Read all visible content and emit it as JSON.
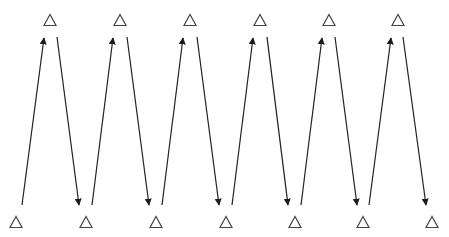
{
  "diagram": {
    "type": "zigzag-triangle-arrows",
    "colors": {
      "stroke": "#222222",
      "triangle": "#444444",
      "background": "#ffffff"
    },
    "top_triangles": [
      {
        "x": 50,
        "y": 20
      },
      {
        "x": 120,
        "y": 20
      },
      {
        "x": 190,
        "y": 20
      },
      {
        "x": 260,
        "y": 20
      },
      {
        "x": 329,
        "y": 20
      },
      {
        "x": 398,
        "y": 20
      }
    ],
    "bottom_triangles": [
      {
        "x": 16,
        "y": 222
      },
      {
        "x": 86,
        "y": 222
      },
      {
        "x": 156,
        "y": 222
      },
      {
        "x": 226,
        "y": 222
      },
      {
        "x": 295,
        "y": 222
      },
      {
        "x": 363,
        "y": 222
      },
      {
        "x": 432,
        "y": 222
      }
    ],
    "arrows": [
      {
        "dir": "up",
        "x1": 22,
        "y1": 205,
        "x2": 44,
        "y2": 38
      },
      {
        "dir": "down",
        "x1": 57,
        "y1": 37,
        "x2": 79,
        "y2": 205
      },
      {
        "dir": "up",
        "x1": 92,
        "y1": 205,
        "x2": 113,
        "y2": 38
      },
      {
        "dir": "down",
        "x1": 127,
        "y1": 37,
        "x2": 149,
        "y2": 205
      },
      {
        "dir": "up",
        "x1": 162,
        "y1": 205,
        "x2": 183,
        "y2": 38
      },
      {
        "dir": "down",
        "x1": 197,
        "y1": 37,
        "x2": 219,
        "y2": 205
      },
      {
        "dir": "up",
        "x1": 232,
        "y1": 205,
        "x2": 253,
        "y2": 38
      },
      {
        "dir": "down",
        "x1": 267,
        "y1": 37,
        "x2": 288,
        "y2": 205
      },
      {
        "dir": "up",
        "x1": 301,
        "y1": 205,
        "x2": 322,
        "y2": 38
      },
      {
        "dir": "down",
        "x1": 335,
        "y1": 37,
        "x2": 357,
        "y2": 205
      },
      {
        "dir": "up",
        "x1": 369,
        "y1": 205,
        "x2": 391,
        "y2": 38
      },
      {
        "dir": "down",
        "x1": 403,
        "y1": 37,
        "x2": 426,
        "y2": 205
      }
    ]
  }
}
